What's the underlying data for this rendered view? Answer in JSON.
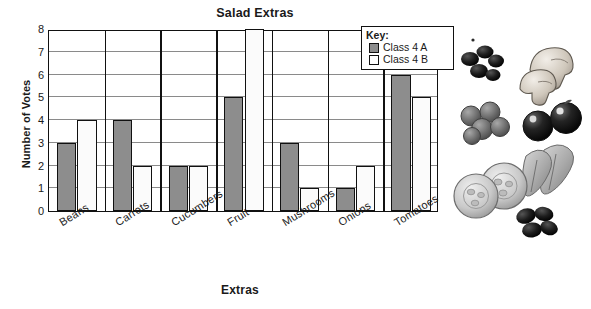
{
  "chart_data": {
    "type": "bar",
    "title": "Salad Extras",
    "xlabel": "Extras",
    "ylabel": "Number of Votes",
    "categories": [
      "Beans",
      "Carrots",
      "Cucumbers",
      "Fruit",
      "Mushrooms",
      "Onions",
      "Tomatoes"
    ],
    "series": [
      {
        "name": "Class 4 A",
        "values": [
          3,
          4,
          2,
          5,
          3,
          1,
          6
        ],
        "color": "#8d8d8d"
      },
      {
        "name": "Class 4 B",
        "values": [
          4,
          2,
          2,
          8,
          1,
          2,
          5
        ],
        "color": "#ffffff"
      }
    ],
    "ylim": [
      0,
      8
    ],
    "yticks": [
      0,
      1,
      2,
      3,
      4,
      5,
      6,
      7,
      8
    ],
    "ytick_labels": [
      "0",
      "1",
      "2",
      "3",
      "4",
      "5",
      "6",
      "7",
      "8"
    ],
    "grid": true,
    "legend_position": "top-right"
  },
  "legend": {
    "title": "Key:",
    "entries": [
      {
        "label": "Class 4 A",
        "swatch": "filled-gray-swatch"
      },
      {
        "label": "Class 4 B",
        "swatch": "empty-white-swatch"
      }
    ]
  },
  "clipart": {
    "items": [
      {
        "name": "black-olives-image"
      },
      {
        "name": "mushrooms-image"
      },
      {
        "name": "grapes-image"
      },
      {
        "name": "cherry-tomatoes-image"
      },
      {
        "name": "cucumber-slices-image"
      },
      {
        "name": "lettuce-leaves-image"
      },
      {
        "name": "black-beans-image"
      }
    ]
  }
}
